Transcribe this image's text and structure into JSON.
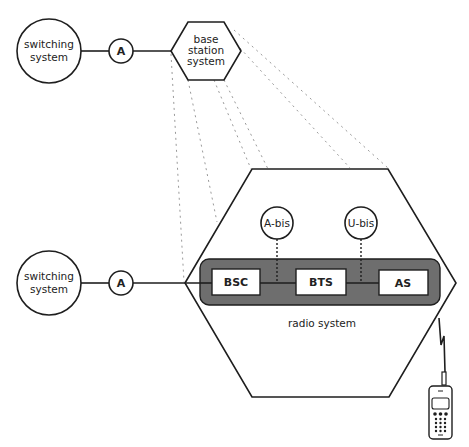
{
  "diagram": {
    "top_row": {
      "switching_system": {
        "line1": "switching",
        "line2": "system"
      },
      "interface": "A",
      "base_station_system": {
        "line1": "base",
        "line2": "station",
        "line3": "system"
      }
    },
    "bottom_row": {
      "switching_system": {
        "line1": "switching",
        "line2": "system"
      },
      "interface": "A"
    },
    "radio_system": {
      "label": "radio system",
      "interfaces": [
        "A-bis",
        "U-bis"
      ],
      "components": [
        "BSC",
        "BTS",
        "AS"
      ]
    },
    "device": "mobile-phone",
    "colors": {
      "line": "#1e1e1e",
      "dotted": "#9a9a9a",
      "container_fill": "#6e6e6e",
      "box_fill": "#ffffff"
    }
  }
}
